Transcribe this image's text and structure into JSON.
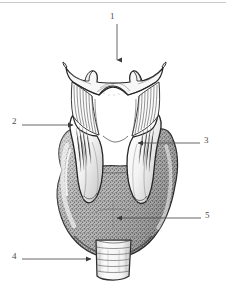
{
  "figure": {
    "background_color": "#ffffff",
    "ink_color": "#3a3a3a",
    "border_color": "#c9c9c9",
    "width": 226,
    "height": 283
  },
  "labels": [
    {
      "id": "label-1",
      "number": "1",
      "target": "hyoid-bone",
      "number_x": 112,
      "number_y": 14,
      "leader": {
        "type": "arrow",
        "x1": 117,
        "y1": 24,
        "x2": 117,
        "y2": 62,
        "direction": "down"
      }
    },
    {
      "id": "label-2",
      "number": "2",
      "target": "superior-thyroid-notch-left-lamina",
      "number_x": 13,
      "number_y": 119,
      "leader": {
        "type": "arrow",
        "x1": 22,
        "y1": 125,
        "x2": 75,
        "y2": 125,
        "direction": "right"
      }
    },
    {
      "id": "label-3",
      "number": "3",
      "target": "thyroid-cartilage-lamina",
      "number_x": 205,
      "number_y": 138,
      "leader": {
        "type": "arrow",
        "x1": 200,
        "y1": 143,
        "x2": 136,
        "y2": 143,
        "direction": "left"
      }
    },
    {
      "id": "label-4",
      "number": "4",
      "target": "trachea",
      "number_x": 13,
      "number_y": 254,
      "leader": {
        "type": "arrow",
        "x1": 22,
        "y1": 259,
        "x2": 93,
        "y2": 259,
        "direction": "right"
      }
    },
    {
      "id": "label-5",
      "number": "5",
      "target": "thyroid-gland-lobe",
      "number_x": 206,
      "number_y": 213,
      "leader": {
        "type": "arrow",
        "x1": 201,
        "y1": 218,
        "x2": 115,
        "y2": 218,
        "direction": "left"
      }
    }
  ],
  "anatomy_parts": [
    {
      "name": "hyoid-bone",
      "description": "Upper horned bone with two superior tubercles"
    },
    {
      "name": "thyrohyoid-membrane",
      "description": "Vertically striated membrane below hyoid"
    },
    {
      "name": "thyroid-cartilage-left-lamina",
      "description": "Pale left cartilage plate"
    },
    {
      "name": "thyroid-cartilage-right-lamina",
      "description": "Pale right cartilage plate"
    },
    {
      "name": "thyroid-gland",
      "description": "Large stippled butterfly-shaped gland"
    },
    {
      "name": "thyroid-isthmus",
      "description": "Central band joining the two lobes"
    },
    {
      "name": "trachea",
      "description": "Ringed tube at the base"
    }
  ]
}
